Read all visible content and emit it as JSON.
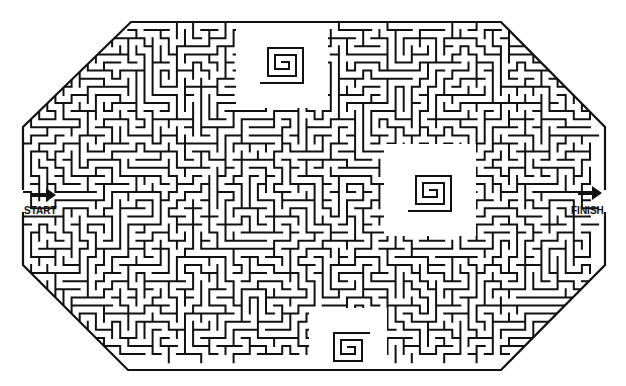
{
  "puzzle": {
    "type": "maze",
    "shape": "octagon",
    "start_label": "START",
    "finish_label": "FINISH",
    "start_arrow_icon": "arrow-right-icon",
    "finish_arrow_icon": "arrow-right-icon",
    "wall_color": "#111111",
    "background_color": "#ffffff"
  }
}
